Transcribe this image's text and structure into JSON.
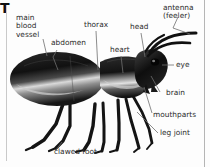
{
  "figure": {
    "subject": "ant",
    "corner_letter": "T",
    "background_color": "#fdfdfd",
    "label_color": "#2b2b2b",
    "leader_line_color": "#6e6e6e",
    "body_color": "#1a1a1a",
    "highlight_color": "#d8d8d8"
  },
  "labels": {
    "main_blood_vessel": "main\nblood\nvessel",
    "abdomen": "abdomen",
    "thorax": "thorax",
    "heart": "heart",
    "head": "head",
    "antenna": "antenna\n(feeler)",
    "eye": "eye",
    "brain": "brain",
    "mouthparts": "mouthparts",
    "leg_joint": "leg joint",
    "clawed_foot": "clawed foot"
  },
  "callouts": [
    {
      "name": "main-blood-vessel",
      "text": "main blood vessel",
      "x": 16,
      "y": 16
    },
    {
      "name": "abdomen",
      "text": "abdomen",
      "x": 52,
      "y": 43
    },
    {
      "name": "thorax",
      "text": "thorax",
      "x": 85,
      "y": 24
    },
    {
      "name": "heart",
      "text": "heart",
      "x": 112,
      "y": 49
    },
    {
      "name": "head",
      "text": "head",
      "x": 131,
      "y": 26
    },
    {
      "name": "antenna-feeler",
      "text": "antenna (feeler)",
      "x": 164,
      "y": 6
    },
    {
      "name": "eye",
      "text": "eye",
      "x": 175,
      "y": 64
    },
    {
      "name": "brain",
      "text": "brain",
      "x": 167,
      "y": 94
    },
    {
      "name": "mouthparts",
      "text": "mouthparts",
      "x": 152,
      "y": 117
    },
    {
      "name": "leg-joint",
      "text": "leg joint",
      "x": 160,
      "y": 134
    },
    {
      "name": "clawed-foot",
      "text": "clawed foot",
      "x": 54,
      "y": 152
    }
  ]
}
